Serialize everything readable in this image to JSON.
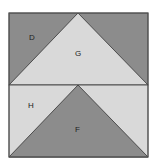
{
  "diagram": {
    "type": "quilt-block",
    "colors": {
      "dark": "#8c8c8c",
      "light": "#d9d9d9",
      "stroke": "#333333",
      "background": "#ffffff"
    },
    "regions": [
      {
        "label": "D",
        "shade": "dark"
      },
      {
        "label": "G",
        "shade": "light"
      },
      {
        "label": "H",
        "shade": "light"
      },
      {
        "label": "F",
        "shade": "dark"
      }
    ]
  }
}
